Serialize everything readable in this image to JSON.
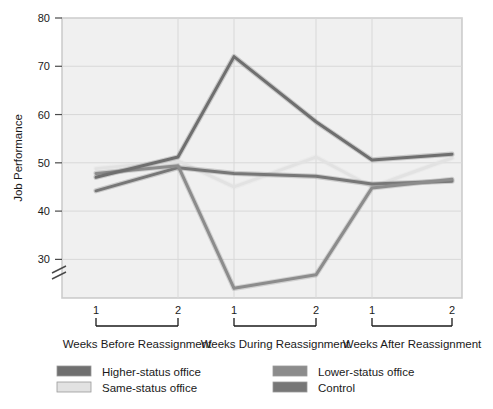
{
  "chart_data": {
    "type": "line",
    "title": "",
    "subtitle": "",
    "xlabel": "",
    "ylabel": "Job Performance",
    "ylim": [
      22,
      80
    ],
    "y_ticks": [
      30,
      40,
      50,
      60,
      70,
      80
    ],
    "y_axis_break": true,
    "grid": true,
    "legend_position": "bottom",
    "x_groups": [
      {
        "label": "Weeks Before Reassignment",
        "ticks": [
          "1",
          "2"
        ]
      },
      {
        "label": "Weeks During Reassignment",
        "ticks": [
          "1",
          "2"
        ]
      },
      {
        "label": "Weeks After Reassignment",
        "ticks": [
          "1",
          "2"
        ]
      }
    ],
    "x": [
      "Before 1",
      "Before 2",
      "During 1",
      "During 2",
      "After 1",
      "After 2"
    ],
    "series": [
      {
        "name": "Higher-status office",
        "color": "#6f6f6f",
        "values": [
          47.0,
          51.2,
          72.0,
          58.5,
          50.6,
          51.8
        ]
      },
      {
        "name": "Same-status office",
        "color": "#e2e2e2",
        "values": [
          48.8,
          50.4,
          45.0,
          51.2,
          45.0,
          51.0
        ]
      },
      {
        "name": "Lower-status office",
        "color": "#8c8c8c",
        "values": [
          47.8,
          49.4,
          24.0,
          26.8,
          44.8,
          46.6
        ]
      },
      {
        "name": "Control",
        "color": "#777777",
        "values": [
          44.2,
          49.0,
          47.8,
          47.2,
          45.6,
          46.2
        ]
      }
    ]
  },
  "legend": {
    "entries": [
      {
        "label": "Higher-status office",
        "color": "#6f6f6f"
      },
      {
        "label": "Lower-status office",
        "color": "#8c8c8c"
      },
      {
        "label": "Same-status office",
        "color": "#e2e2e2"
      },
      {
        "label": "Control",
        "color": "#777777"
      }
    ]
  },
  "axis": {
    "y_label": "Job Performance",
    "y_tick_80": "80",
    "y_tick_70": "70",
    "y_tick_60": "60",
    "y_tick_50": "50",
    "y_tick_40": "40",
    "y_tick_30": "30"
  },
  "xaxis": {
    "g1_t1": "1",
    "g1_t2": "2",
    "g2_t1": "1",
    "g2_t2": "2",
    "g3_t1": "1",
    "g3_t2": "2",
    "g1_label": "Weeks Before Reassignment",
    "g2_label": "Weeks During Reassignment",
    "g3_label": "Weeks After Reassignment"
  },
  "legend_labels": {
    "higher": "Higher-status office",
    "same": "Same-status office",
    "lower": "Lower-status office",
    "control": "Control"
  }
}
